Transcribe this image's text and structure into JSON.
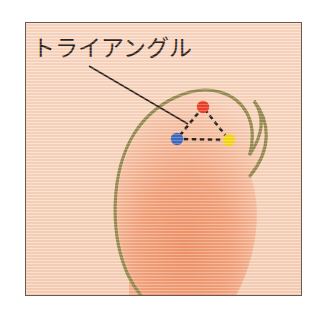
{
  "figure": {
    "annotation_label": "トライアングル",
    "caption_romaji": "toraianguru",
    "frame": {
      "border_color": "#6b5a52",
      "background_color": "#f9d7c1"
    },
    "blob": {
      "outline_color": "#8a8446",
      "fill_start_color": "#f0946a",
      "fill_end_color": "#f8d3bd",
      "description": "egg-shaped outline"
    },
    "leader_line": {
      "color": "#17120f",
      "from_x": 88,
      "from_y": 65,
      "to_x": 187,
      "to_y": 123
    },
    "triangle": {
      "edge_color": "#111111",
      "edge_style": "dashed",
      "vertices": [
        {
          "name": "apex-vertex",
          "color": "#e8341c",
          "x": 202,
          "y": 106
        },
        {
          "name": "left-vertex",
          "color": "#2a5fc0",
          "x": 176,
          "y": 138
        },
        {
          "name": "right-vertex",
          "color": "#f5d90a",
          "x": 228,
          "y": 139
        }
      ]
    }
  }
}
